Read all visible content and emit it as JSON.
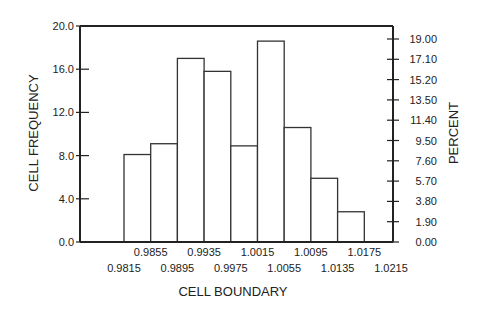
{
  "chart_data": {
    "type": "bar",
    "title": "",
    "xlabel": "CELL BOUNDARY",
    "ylabel": "CELL FREQUENCY",
    "y2label": "PERCENT",
    "ylim": [
      0,
      20
    ],
    "y_ticks": [
      "0.0",
      "4.0",
      "8.0",
      "12.0",
      "16.0",
      "20.0"
    ],
    "y2_ticks": [
      "0.00",
      "1.90",
      "3.80",
      "5.70",
      "7.60",
      "9.50",
      "11.40",
      "13.50",
      "15.20",
      "17.10",
      "19.00"
    ],
    "x_ticks_upper": [
      "0.9855",
      "0.9935",
      "1.0015",
      "1.0095",
      "1.0175"
    ],
    "x_ticks_lower": [
      "0.9815",
      "0.9895",
      "0.9975",
      "1.0055",
      "1.0135",
      "1.0215"
    ],
    "bin_edges": [
      0.9815,
      0.9855,
      0.9895,
      0.9935,
      0.9975,
      1.0015,
      1.0055,
      1.0095,
      1.0135,
      1.0175,
      1.0215
    ],
    "values": [
      8.1,
      9.1,
      17.0,
      15.8,
      8.9,
      18.6,
      10.6,
      5.9,
      2.8
    ],
    "grid": false,
    "legend": "none"
  }
}
